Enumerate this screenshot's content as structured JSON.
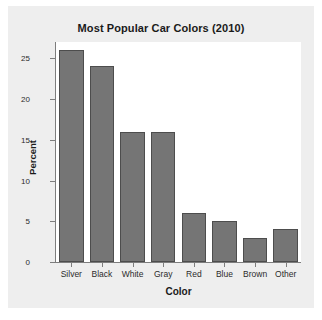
{
  "chart_data": {
    "type": "bar",
    "title": "Most Popular Car Colors (2010)",
    "xlabel": "Color",
    "ylabel": "Percent",
    "categories": [
      "Silver",
      "Black",
      "White",
      "Gray",
      "Red",
      "Blue",
      "Brown",
      "Other"
    ],
    "values": [
      26,
      24,
      16,
      16,
      6,
      5,
      3,
      4
    ],
    "ylim": [
      0,
      27
    ],
    "yticks": [
      0,
      5,
      10,
      15,
      20,
      25
    ],
    "ytick_labels": [
      "0",
      "5",
      "10",
      "15",
      "20",
      "25"
    ],
    "grid": false,
    "legend": null,
    "bar_color": "#757575",
    "bar_border_color": "#4d4d4d",
    "plot_background": "#ffffff",
    "card_background": "#eeeeee",
    "axis_color": "#7d7d7d",
    "text_color": "#1a1a1a"
  }
}
